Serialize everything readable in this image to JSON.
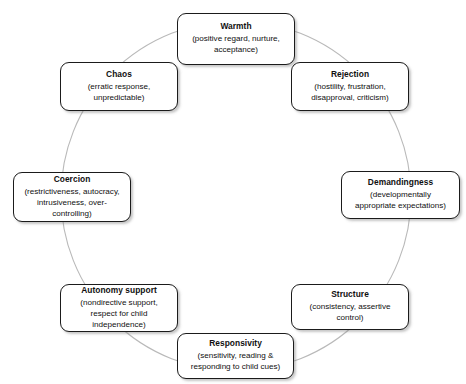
{
  "diagram": {
    "type": "circumplex",
    "title": "",
    "circle": {
      "center_x": 236,
      "center_y": 196,
      "radius": 175,
      "stroke_color": "#b9b9b9"
    },
    "node_style": {
      "border_color": "#1b1b1b",
      "fill_color": "#ffffff",
      "text_color": "#101010"
    },
    "nodes": [
      {
        "id": "warmth",
        "title": "Warmth",
        "desc": "(positive regard, nurture,\nacceptance)"
      },
      {
        "id": "rejection",
        "title": "Rejection",
        "desc": "(hostility, frustration,\ndisapproval, criticism)"
      },
      {
        "id": "demandingness",
        "title": "Demandingness",
        "desc": "(developmentally\nappropriate expectations)"
      },
      {
        "id": "structure",
        "title": "Structure",
        "desc": "(consistency, assertive\ncontrol)"
      },
      {
        "id": "responsivity",
        "title": "Responsivity",
        "desc": "(sensitivity, reading &\nresponding to child cues)"
      },
      {
        "id": "autonomy_support",
        "title": "Autonomy support",
        "desc": "(nondirective support,\nrespect for child\nindependence)"
      },
      {
        "id": "coercion",
        "title": "Coercion",
        "desc": "(restrictiveness, autocracy,\nintrusiveness, over-\ncontrolling)"
      },
      {
        "id": "chaos",
        "title": "Chaos",
        "desc": "(erratic response,\nunpredictable)"
      }
    ]
  }
}
